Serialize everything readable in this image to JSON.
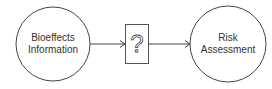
{
  "diagram": {
    "nodes": [
      {
        "id": "bioeffects",
        "shape": "circle",
        "lines": [
          "Bioeffects",
          "Information"
        ]
      },
      {
        "id": "unknown",
        "shape": "box",
        "label": "?"
      },
      {
        "id": "risk",
        "shape": "circle",
        "lines": [
          "Risk",
          "Assessment"
        ]
      }
    ],
    "edges": [
      {
        "from": "bioeffects",
        "to": "unknown",
        "style": "arrow"
      },
      {
        "from": "unknown",
        "to": "risk",
        "style": "arrow"
      }
    ],
    "colors": {
      "stroke": "#444444",
      "text": "#333333",
      "background": "#ffffff"
    }
  }
}
